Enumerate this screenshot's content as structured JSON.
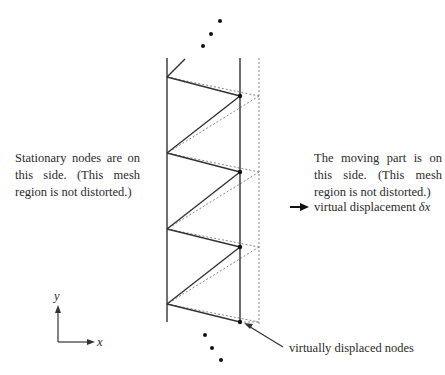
{
  "labels": {
    "stationary_note": "Stationary nodes are on this side. (This mesh region is not distorted.)",
    "moving_note": "The moving part is on this side. (This mesh region is not distorted.)",
    "virtual_displacement": "virtual displacement",
    "virtual_displacement_symbol": "δx",
    "displaced_nodes": "virtually displaced nodes",
    "axis_x": "x",
    "axis_y": "y"
  },
  "colors": {
    "solid_line": "#333333",
    "dotted_line": "#888888",
    "node": "#111111"
  },
  "mesh": {
    "left_x": 167,
    "right_x": 240,
    "displaced_x": 259,
    "left_nodes_y": [
      77,
      153,
      229,
      304
    ],
    "right_nodes_y": [
      96,
      172,
      247,
      322
    ]
  }
}
